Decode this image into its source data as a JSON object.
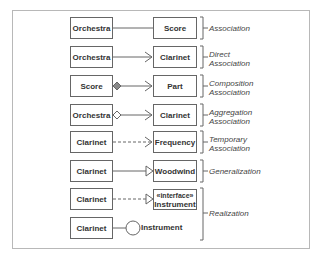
{
  "diagram": {
    "rows": [
      {
        "left": "Orchestra",
        "right": "Score",
        "relation": "Association",
        "line": "solid",
        "end": "none",
        "start": "none"
      },
      {
        "left": "Orchestra",
        "right": "Clarinet",
        "relation": "Direct Association",
        "line": "solid",
        "end": "open-arrow",
        "start": "none"
      },
      {
        "left": "Score",
        "right": "Part",
        "relation": "Composition Association",
        "line": "solid",
        "end": "open-arrow",
        "start": "filled-diamond"
      },
      {
        "left": "Orchestra",
        "right": "Clarinet",
        "relation": "Aggregation Association",
        "line": "solid",
        "end": "open-arrow",
        "start": "hollow-diamond"
      },
      {
        "left": "Clarinet",
        "right": "Frequency",
        "relation": "Temporary Association",
        "line": "dashed",
        "end": "open-arrow",
        "start": "none"
      },
      {
        "left": "Clarinet",
        "right": "Woodwind",
        "relation": "Generalization",
        "line": "solid",
        "end": "hollow-triangle",
        "start": "none"
      },
      {
        "left": "Clarinet",
        "right_stereotype": "«interface»",
        "right": "Instrument",
        "relation": "Realization",
        "line": "dashed",
        "end": "hollow-triangle",
        "start": "none"
      },
      {
        "left": "Clarinet",
        "right": "Instrument",
        "relation": "Realization",
        "line": "solid",
        "end": "lollipop-circle",
        "start": "none"
      }
    ],
    "labels": {
      "association": "Association",
      "direct_1": "Direct",
      "direct_2": "Association",
      "composition_1": "Composition",
      "composition_2": "Association",
      "aggregation_1": "Aggregation",
      "aggregation_2": "Association",
      "temporary_1": "Temporary",
      "temporary_2": "Association",
      "generalization": "Generalization",
      "realization": "Realization"
    },
    "colors": {
      "stroke": "#666666",
      "frame": "#b8b8b8",
      "composition_fill": "#888888"
    }
  }
}
